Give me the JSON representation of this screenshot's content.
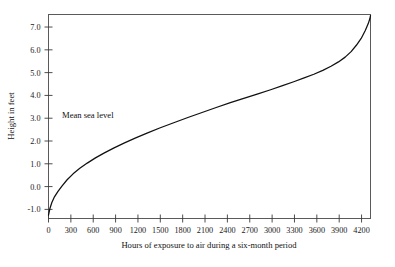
{
  "chart_data": {
    "type": "line",
    "title": "",
    "xlabel": "Hours of exposure to air during a six-month period",
    "ylabel": "Height in feet",
    "xlim": [
      0,
      4320
    ],
    "ylim": [
      -1.4,
      7.55
    ],
    "grid": false,
    "legend": "none",
    "xticks": [
      0,
      300,
      600,
      900,
      1200,
      1500,
      1800,
      2100,
      2400,
      2700,
      3000,
      3300,
      3600,
      3900,
      4200
    ],
    "xticklabels": [
      "0",
      "300",
      "600",
      "900",
      "1200",
      "1500",
      "1800",
      "2100",
      "2400",
      "2700",
      "3000",
      "3300",
      "3600",
      "3900",
      "4200"
    ],
    "yticks": [
      -1.0,
      0.0,
      1.0,
      2.0,
      3.0,
      4.0,
      5.0,
      6.0,
      7.0
    ],
    "yticklabels": [
      "-1.0",
      "0.0",
      "1.0",
      "2.0",
      "3.0",
      "4.0",
      "5.0",
      "6.0",
      "7.0"
    ],
    "annotations": [
      {
        "text": "Mean sea level",
        "x": 300,
        "y": 3.0
      }
    ],
    "series": [
      {
        "name": "Tidal exposure curve",
        "color": "#101010",
        "x": [
          0,
          20,
          45,
          80,
          125,
          180,
          250,
          330,
          420,
          520,
          630,
          750,
          880,
          1020,
          1170,
          1330,
          1500,
          1680,
          1870,
          2060,
          2250,
          2440,
          2630,
          2810,
          2980,
          3140,
          3290,
          3430,
          3560,
          3680,
          3790,
          3890,
          3980,
          4060,
          4130,
          4195,
          4250,
          4290,
          4310,
          4320
        ],
        "y": [
          -1.25,
          -0.95,
          -0.7,
          -0.45,
          -0.22,
          0.02,
          0.3,
          0.56,
          0.8,
          1.03,
          1.26,
          1.48,
          1.7,
          1.92,
          2.14,
          2.36,
          2.58,
          2.8,
          3.03,
          3.25,
          3.47,
          3.68,
          3.88,
          4.07,
          4.25,
          4.43,
          4.6,
          4.77,
          4.93,
          5.1,
          5.28,
          5.47,
          5.68,
          5.92,
          6.2,
          6.5,
          6.85,
          7.15,
          7.35,
          7.5
        ]
      }
    ]
  },
  "axes": {
    "x_axis_name": "hours-of-exposure-axis",
    "y_axis_name": "height-in-feet-axis"
  }
}
